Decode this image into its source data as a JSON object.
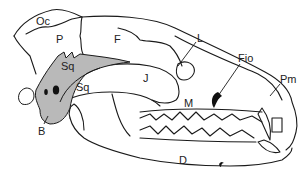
{
  "diagram": {
    "colors": {
      "line": "#1a1a1a",
      "shade": "#b9b9b9",
      "background": "#ffffff"
    },
    "labels": [
      {
        "id": "oc",
        "text": "Oc",
        "x": 36,
        "y": 16
      },
      {
        "id": "p",
        "text": "P",
        "x": 56,
        "y": 34
      },
      {
        "id": "f",
        "text": "F",
        "x": 114,
        "y": 34
      },
      {
        "id": "l",
        "text": "L",
        "x": 197,
        "y": 33
      },
      {
        "id": "fio",
        "text": "Fio",
        "x": 238,
        "y": 53
      },
      {
        "id": "pm",
        "text": "Pm",
        "x": 280,
        "y": 74
      },
      {
        "id": "sq-upper",
        "text": "Sq",
        "x": 61,
        "y": 61
      },
      {
        "id": "sq-lower",
        "text": "Sq",
        "x": 76,
        "y": 82
      },
      {
        "id": "j",
        "text": "J",
        "x": 143,
        "y": 73
      },
      {
        "id": "m",
        "text": "M",
        "x": 184,
        "y": 98
      },
      {
        "id": "b",
        "text": "B",
        "x": 38,
        "y": 126
      },
      {
        "id": "d",
        "text": "D",
        "x": 179,
        "y": 155
      }
    ]
  }
}
